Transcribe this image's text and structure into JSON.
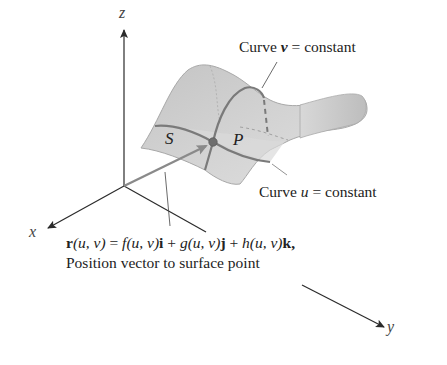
{
  "figure": {
    "axes": {
      "x_label": "x",
      "y_label": "y",
      "z_label": "z"
    },
    "surface_labels": {
      "S": "S",
      "P": "P"
    },
    "annotations": {
      "curve_v": {
        "prefix": "Curve ",
        "var": "v",
        "suffix": " = constant"
      },
      "curve_u": {
        "prefix": "Curve ",
        "var": "u",
        "suffix": " = constant"
      },
      "position_vector": {
        "equation": {
          "r": "r",
          "args1": "(u, v)",
          "eq": " = ",
          "f": "f",
          "args2": "(u, v)",
          "i": "i",
          "plus1": " + ",
          "g": "g",
          "args3": "(u, v)",
          "j": "j",
          "plus2": " + ",
          "h": "h",
          "args4": "(u, v)",
          "k": "k",
          "comma": ","
        },
        "caption": "Position vector to surface point"
      }
    },
    "colors": {
      "surface_fill": "#c9c9c9",
      "surface_light": "#dcdcdc",
      "surface_edge": "#a8a8a8",
      "curve_stroke": "#7a7a7a",
      "point_fill": "#6e6e6e",
      "axis_stroke": "#2b2b2b",
      "vector_stroke": "#8a8a8a"
    }
  }
}
